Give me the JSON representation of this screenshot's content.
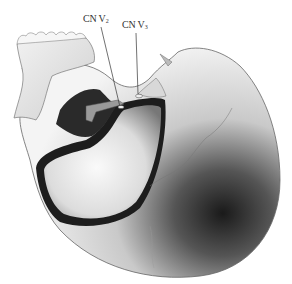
{
  "figure": {
    "labels": [
      {
        "id": "cn-v2",
        "text": "CN V",
        "sub": "2",
        "x": 83,
        "y": 13
      },
      {
        "id": "cn-v3",
        "text": "CN V",
        "sub": "3",
        "x": 122,
        "y": 19
      }
    ]
  }
}
